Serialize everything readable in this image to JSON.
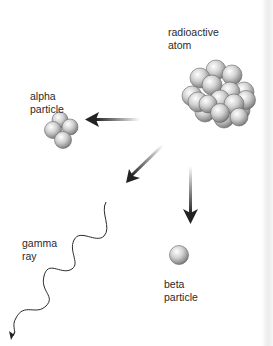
{
  "diagram": {
    "nodes": [
      {
        "id": "atom",
        "label": "radioactive\natom"
      },
      {
        "id": "alpha",
        "label": "alpha\nparticle"
      },
      {
        "id": "gamma",
        "label": "gamma\nray"
      },
      {
        "id": "beta",
        "label": "beta\nparticle"
      }
    ],
    "edges": [
      {
        "from": "atom",
        "to": "alpha",
        "style": "gradient-arrow"
      },
      {
        "from": "atom",
        "to": "gamma",
        "style": "gradient-arrow"
      },
      {
        "from": "atom",
        "to": "beta",
        "style": "gradient-arrow"
      }
    ],
    "colors": {
      "sphere_light": "#f4f4f4",
      "sphere_dark": "#6e6e6e",
      "arrow": "#222222",
      "text": "#2a2a2a"
    }
  }
}
